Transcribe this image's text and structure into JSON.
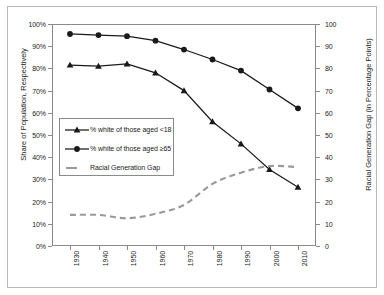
{
  "chart_data": {
    "type": "line",
    "title": "",
    "x": [
      1930,
      1940,
      1950,
      1960,
      1970,
      1980,
      1990,
      2000,
      2010
    ],
    "categories": [
      "1930",
      "1940",
      "1950",
      "1960",
      "1970",
      "1980",
      "1990",
      "2000",
      "2010"
    ],
    "series": [
      {
        "name": "% white of those aged <18",
        "marker": "triangle",
        "color": "#1a1a1a",
        "style": "solid",
        "axis": "left",
        "values": [
          81.5,
          81.0,
          82.0,
          78.0,
          70.0,
          56.0,
          46.0,
          34.5,
          26.5
        ]
      },
      {
        "name": "% white of those aged ≥65",
        "marker": "circle",
        "color": "#1a1a1a",
        "style": "solid",
        "axis": "left",
        "values": [
          95.5,
          95.0,
          94.5,
          92.5,
          88.5,
          84.0,
          79.0,
          70.5,
          62.0
        ]
      },
      {
        "name": "Racial Generation Gap",
        "marker": "none",
        "color": "#9a9a9a",
        "style": "dashed",
        "axis": "right",
        "values": [
          14.0,
          14.0,
          12.5,
          14.5,
          18.5,
          28.0,
          33.0,
          36.0,
          35.5
        ]
      }
    ],
    "xlabel": "",
    "ylabel": "Share of Population, Respectively",
    "y2label": "Racial Generation Gap (in Percentage Points)",
    "ylim": [
      0,
      100
    ],
    "y2lim": [
      0,
      100
    ],
    "yticks": [
      "0%",
      "10%",
      "20%",
      "30%",
      "40%",
      "50%",
      "60%",
      "70%",
      "80%",
      "90%",
      "100%"
    ],
    "ytick_values": [
      0,
      10,
      20,
      30,
      40,
      50,
      60,
      70,
      80,
      90,
      100
    ],
    "y2ticks": [
      "0",
      "10",
      "20",
      "30",
      "40",
      "50",
      "60",
      "70",
      "80",
      "90",
      "100"
    ],
    "y2tick_values": [
      0,
      10,
      20,
      30,
      40,
      50,
      60,
      70,
      80,
      90,
      100
    ],
    "grid": false,
    "legend_position": "center-left",
    "legend": [
      "% white of those aged <18",
      "% white of those aged ≥65",
      "Racial Generation Gap"
    ]
  }
}
